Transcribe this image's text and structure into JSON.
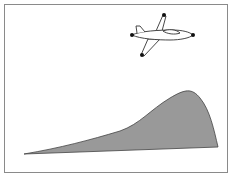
{
  "diagram": {
    "frame": {
      "stroke": "#8a8a8a"
    },
    "hill": {
      "fill": "#999999",
      "stroke": "#444444",
      "path": "M24 154 C 60 148, 90 140, 120 131 C 140 124, 150 110, 170 98 C 185 89, 192 88, 200 98 C 210 110, 214 130, 218 147 Z"
    },
    "airplane": {
      "stroke": "#333333",
      "fill": "#ffffff",
      "dot_color": "#111111",
      "points": {
        "nose": [
          193,
          35
        ],
        "tail": [
          132,
          35
        ],
        "upper_wing": [
          164,
          15
        ],
        "lower_wing": [
          142,
          55
        ]
      }
    }
  }
}
